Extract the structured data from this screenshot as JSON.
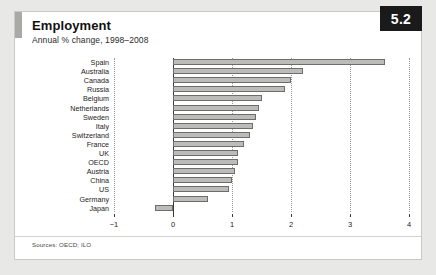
{
  "figure": {
    "badge": "5.2",
    "title": "Employment",
    "subtitle": "Annual % change, 1998–2008",
    "sources": "Sources: OECD; ILO"
  },
  "chart_data": {
    "type": "bar",
    "orientation": "horizontal",
    "title": "Employment",
    "subtitle": "Annual % change, 1998–2008",
    "xlabel": "",
    "ylabel": "",
    "xlim": [
      -1,
      4
    ],
    "xticks": [
      -1,
      0,
      1,
      2,
      3,
      4
    ],
    "xtick_labels": [
      "−1",
      "0",
      "1",
      "2",
      "3",
      "4"
    ],
    "grid": "vertical-dotted",
    "legend": "none",
    "bar_color": "#bcbcba",
    "bar_edge_color": "#6d6d6b",
    "categories": [
      "Spain",
      "Australia",
      "Canada",
      "Russia",
      "Belgium",
      "Netherlands",
      "Sweden",
      "Italy",
      "Switzerland",
      "France",
      "UK",
      "OECD",
      "Austria",
      "China",
      "US",
      "Germany",
      "Japan"
    ],
    "values": [
      3.6,
      2.2,
      2.0,
      1.9,
      1.5,
      1.45,
      1.4,
      1.35,
      1.3,
      1.2,
      1.1,
      1.1,
      1.05,
      1.0,
      0.95,
      0.6,
      -0.3
    ],
    "sources": "Sources: OECD; ILO"
  }
}
